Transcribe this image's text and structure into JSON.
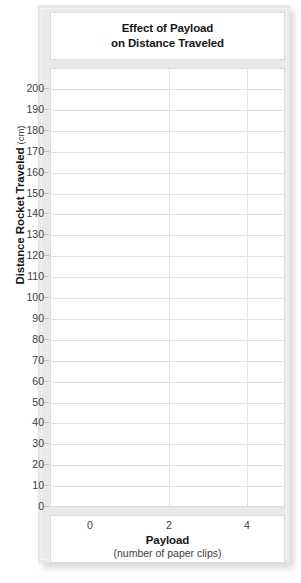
{
  "chart_data": {
    "type": "line",
    "title": "Effect of Payload on Distance Traveled",
    "title_lines": [
      "Effect of Payload",
      "on Distance Traveled"
    ],
    "xlabel": "Payload",
    "xlabel_unit": "(number of paper clips)",
    "ylabel": "Distance Rocket Traveled",
    "ylabel_unit": "(cm)",
    "xlim": [
      -1,
      5
    ],
    "ylim": [
      0,
      200
    ],
    "x_ticks": [
      0,
      2,
      4
    ],
    "x_tick_labels": [
      "0",
      "2",
      "4"
    ],
    "y_ticks": [
      0,
      10,
      20,
      30,
      40,
      50,
      60,
      70,
      80,
      90,
      100,
      110,
      120,
      130,
      140,
      150,
      160,
      170,
      180,
      190,
      200
    ],
    "y_tick_labels": [
      "0",
      "10",
      "20",
      "30",
      "40",
      "50",
      "60",
      "70",
      "80",
      "90",
      "100",
      "110",
      "120",
      "130",
      "140",
      "150",
      "160",
      "170",
      "180",
      "190",
      "200"
    ],
    "grid": true,
    "grid_axes": "both",
    "legend": false,
    "series": [
      {
        "name": "",
        "x": [],
        "values": []
      }
    ],
    "annotations": [],
    "note": "blank graph template; no data plotted",
    "colors": {
      "frame": "#e9e9e9",
      "panel": "#ffffff",
      "gridline": "#e2e2e2",
      "border": "#dcdcdc",
      "text": "#151515",
      "tick_text": "#3d3d3d"
    }
  }
}
